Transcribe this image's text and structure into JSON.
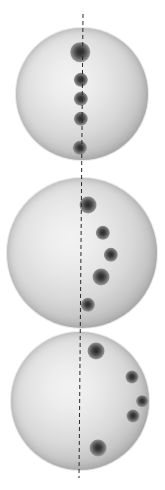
{
  "figure": {
    "background_color": "#ffffff",
    "width": 165,
    "height": 490,
    "sphere_fill_center": "#f2f2f2",
    "sphere_fill_limb": "#949494",
    "spot_color": "#2b2b2b",
    "axis_color": "#2a2a2a",
    "axis_style": "dashed"
  },
  "axis": {
    "name": "rotation-axis",
    "x_top": 83,
    "y_top": 14,
    "x_bottom": 79,
    "y_bottom": 478
  },
  "discs": [
    {
      "label": "disc-top",
      "cx": 82,
      "cy": 94,
      "r": 66,
      "spots": [
        {
          "label": "spot-1",
          "x": 80,
          "y": 52,
          "r": 7.5
        },
        {
          "label": "spot-2",
          "x": 81,
          "y": 80,
          "r": 5.5
        },
        {
          "label": "spot-3",
          "x": 81,
          "y": 99,
          "r": 5.5
        },
        {
          "label": "spot-4",
          "x": 81,
          "y": 119,
          "r": 5.5
        },
        {
          "label": "spot-5",
          "x": 80,
          "y": 148,
          "r": 5.5
        }
      ]
    },
    {
      "label": "disc-middle",
      "cx": 82,
      "cy": 253,
      "r": 75,
      "spots": [
        {
          "label": "spot-1",
          "x": 88,
          "y": 205,
          "r": 6.5
        },
        {
          "label": "spot-2",
          "x": 103,
          "y": 233,
          "r": 5.5
        },
        {
          "label": "spot-3",
          "x": 111,
          "y": 255,
          "r": 5.5
        },
        {
          "label": "spot-4",
          "x": 101,
          "y": 277,
          "r": 6.5
        },
        {
          "label": "spot-5",
          "x": 88,
          "y": 305,
          "r": 5.5
        }
      ]
    },
    {
      "label": "disc-bottom",
      "cx": 80,
      "cy": 401,
      "r": 69,
      "spots": [
        {
          "label": "spot-1",
          "x": 96,
          "y": 351,
          "r": 6.5
        },
        {
          "label": "spot-2",
          "x": 132,
          "y": 377,
          "r": 5.0
        },
        {
          "label": "spot-3",
          "x": 142,
          "y": 401,
          "r": 4.5
        },
        {
          "label": "spot-4",
          "x": 133,
          "y": 416,
          "r": 5.0
        },
        {
          "label": "spot-5",
          "x": 98,
          "y": 448,
          "r": 6.5
        }
      ]
    }
  ]
}
